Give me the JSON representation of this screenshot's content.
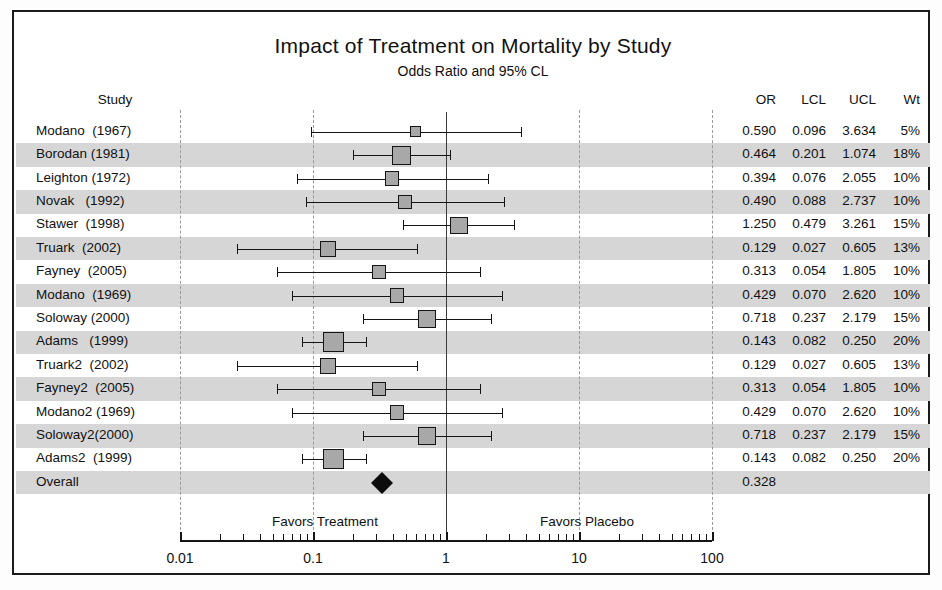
{
  "chart_data": {
    "type": "forest",
    "title": "Impact of Treatment on Mortality by Study",
    "subtitle": "Odds Ratio and 95% CL",
    "xlabel": "",
    "ylabel": "",
    "scale": "log10",
    "xlim": [
      0.01,
      100
    ],
    "null_value": 1,
    "grid": true,
    "gridlines": [
      0.01,
      0.1,
      10,
      100
    ],
    "tick_labels": [
      "0.01",
      "0.1",
      "1",
      "10",
      "100"
    ],
    "tick_values": [
      0.01,
      0.1,
      1,
      10,
      100
    ],
    "favors_left_label": "Favors Treatment",
    "favors_right_label": "Favors Placebo",
    "columns": {
      "study": "Study",
      "or": "OR",
      "lcl": "LCL",
      "ucl": "UCL",
      "wt": "Wt"
    },
    "rows": [
      {
        "study": "Modano  (1967)",
        "or": 0.59,
        "lcl": 0.096,
        "ucl": 3.634,
        "wt": 5,
        "or_text": "0.590",
        "lcl_text": "0.096",
        "ucl_text": "3.634",
        "wt_text": "5%"
      },
      {
        "study": "Borodan (1981)",
        "or": 0.464,
        "lcl": 0.201,
        "ucl": 1.074,
        "wt": 18,
        "or_text": "0.464",
        "lcl_text": "0.201",
        "ucl_text": "1.074",
        "wt_text": "18%"
      },
      {
        "study": "Leighton (1972)",
        "or": 0.394,
        "lcl": 0.076,
        "ucl": 2.055,
        "wt": 10,
        "or_text": "0.394",
        "lcl_text": "0.076",
        "ucl_text": "2.055",
        "wt_text": "10%"
      },
      {
        "study": "Novak   (1992)",
        "or": 0.49,
        "lcl": 0.088,
        "ucl": 2.737,
        "wt": 10,
        "or_text": "0.490",
        "lcl_text": "0.088",
        "ucl_text": "2.737",
        "wt_text": "10%"
      },
      {
        "study": "Stawer  (1998)",
        "or": 1.25,
        "lcl": 0.479,
        "ucl": 3.261,
        "wt": 15,
        "or_text": "1.250",
        "lcl_text": "0.479",
        "ucl_text": "3.261",
        "wt_text": "15%"
      },
      {
        "study": "Truark  (2002)",
        "or": 0.129,
        "lcl": 0.027,
        "ucl": 0.605,
        "wt": 13,
        "or_text": "0.129",
        "lcl_text": "0.027",
        "ucl_text": "0.605",
        "wt_text": "13%"
      },
      {
        "study": "Fayney  (2005)",
        "or": 0.313,
        "lcl": 0.054,
        "ucl": 1.805,
        "wt": 10,
        "or_text": "0.313",
        "lcl_text": "0.054",
        "ucl_text": "1.805",
        "wt_text": "10%"
      },
      {
        "study": "Modano  (1969)",
        "or": 0.429,
        "lcl": 0.07,
        "ucl": 2.62,
        "wt": 10,
        "or_text": "0.429",
        "lcl_text": "0.070",
        "ucl_text": "2.620",
        "wt_text": "10%"
      },
      {
        "study": "Soloway (2000)",
        "or": 0.718,
        "lcl": 0.237,
        "ucl": 2.179,
        "wt": 15,
        "or_text": "0.718",
        "lcl_text": "0.237",
        "ucl_text": "2.179",
        "wt_text": "15%"
      },
      {
        "study": "Adams   (1999)",
        "or": 0.143,
        "lcl": 0.082,
        "ucl": 0.25,
        "wt": 20,
        "or_text": "0.143",
        "lcl_text": "0.082",
        "ucl_text": "0.250",
        "wt_text": "20%"
      },
      {
        "study": "Truark2  (2002)",
        "or": 0.129,
        "lcl": 0.027,
        "ucl": 0.605,
        "wt": 13,
        "or_text": "0.129",
        "lcl_text": "0.027",
        "ucl_text": "0.605",
        "wt_text": "13%"
      },
      {
        "study": "Fayney2  (2005)",
        "or": 0.313,
        "lcl": 0.054,
        "ucl": 1.805,
        "wt": 10,
        "or_text": "0.313",
        "lcl_text": "0.054",
        "ucl_text": "1.805",
        "wt_text": "10%"
      },
      {
        "study": "Modano2 (1969)",
        "or": 0.429,
        "lcl": 0.07,
        "ucl": 2.62,
        "wt": 10,
        "or_text": "0.429",
        "lcl_text": "0.070",
        "ucl_text": "2.620",
        "wt_text": "10%"
      },
      {
        "study": "Soloway2(2000)",
        "or": 0.718,
        "lcl": 0.237,
        "ucl": 2.179,
        "wt": 15,
        "or_text": "0.718",
        "lcl_text": "0.237",
        "ucl_text": "2.179",
        "wt_text": "15%"
      },
      {
        "study": "Adams2  (1999)",
        "or": 0.143,
        "lcl": 0.082,
        "ucl": 0.25,
        "wt": 20,
        "or_text": "0.143",
        "lcl_text": "0.082",
        "ucl_text": "0.250",
        "wt_text": "20%"
      },
      {
        "study": "Overall",
        "or": 0.328,
        "lcl": null,
        "ucl": null,
        "wt": null,
        "or_text": "0.328",
        "lcl_text": "",
        "ucl_text": "",
        "wt_text": "",
        "summary": true
      }
    ],
    "colors": {
      "marker_fill": "#a8a8a8",
      "marker_edge": "#151515",
      "diamond": "#0c0c0c",
      "band": "#d6d6d6",
      "gridline": "#9a9a9a",
      "null_line": "#3a3a3a",
      "frame": "#1b1b1b",
      "text": "#111111"
    }
  }
}
